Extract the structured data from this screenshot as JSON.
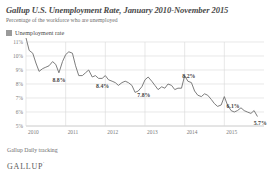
{
  "title": "Gallup U.S. Unemployment Rate, January 2010-November 2015",
  "subtitle": "Percentage of the workforce who are unemployed",
  "legend": {
    "label": "Unemployment rate",
    "swatch_color": "#9a9a9a"
  },
  "footnote": "Gallup Daily tracking",
  "brand": "GALLUP",
  "brand_mark": "'",
  "colors": {
    "line": "#6e6e6e",
    "grid": "#d9d9d9",
    "axis": "#bdbdbd",
    "text": "#6d6d6d",
    "label": "#3f3f3f"
  },
  "chart_data": {
    "type": "line",
    "title": "Gallup U.S. Unemployment Rate, January 2010-November 2015",
    "subtitle": "Percentage of the workforce who are unemployed",
    "xlabel": "",
    "ylabel": "",
    "ylim": [
      5,
      11
    ],
    "yticks": [
      "5%",
      "6%",
      "7%",
      "8%",
      "9%",
      "10%",
      "11%"
    ],
    "ytick_values": [
      5,
      6,
      7,
      8,
      9,
      10,
      11
    ],
    "xticks": [
      "2010",
      "2011",
      "2012",
      "2013",
      "2014",
      "2015"
    ],
    "xtick_values": [
      2010,
      2011,
      2012,
      2013,
      2014,
      2015
    ],
    "grid": true,
    "legend_position": "top-left",
    "series": [
      {
        "name": "Unemployment rate",
        "color": "#6e6e6e",
        "x": [
          2010.0,
          2010.08,
          2010.17,
          2010.25,
          2010.33,
          2010.42,
          2010.5,
          2010.58,
          2010.67,
          2010.75,
          2010.83,
          2010.92,
          2011.0,
          2011.08,
          2011.17,
          2011.25,
          2011.33,
          2011.42,
          2011.5,
          2011.58,
          2011.67,
          2011.75,
          2011.83,
          2011.92,
          2012.0,
          2012.08,
          2012.17,
          2012.25,
          2012.33,
          2012.42,
          2012.5,
          2012.58,
          2012.67,
          2012.75,
          2012.83,
          2012.92,
          2013.0,
          2013.08,
          2013.17,
          2013.25,
          2013.33,
          2013.42,
          2013.5,
          2013.58,
          2013.67,
          2013.75,
          2013.83,
          2013.92,
          2014.0,
          2014.08,
          2014.17,
          2014.25,
          2014.33,
          2014.42,
          2014.5,
          2014.58,
          2014.67,
          2014.75,
          2014.83,
          2014.92,
          2015.0,
          2015.08,
          2015.17,
          2015.25,
          2015.33,
          2015.42,
          2015.5,
          2015.58,
          2015.67,
          2015.75,
          2015.83
        ],
        "values": [
          11.3,
          10.4,
          10.2,
          9.5,
          8.9,
          9.1,
          9.2,
          9.3,
          9.6,
          9.4,
          8.8,
          9.6,
          10.1,
          10.3,
          10.2,
          9.3,
          8.6,
          8.6,
          8.8,
          9.0,
          8.5,
          8.6,
          8.4,
          8.4,
          8.6,
          8.3,
          8.2,
          8.1,
          7.9,
          8.1,
          8.2,
          8.1,
          7.9,
          7.4,
          7.5,
          7.8,
          8.3,
          8.5,
          8.2,
          7.9,
          7.6,
          7.8,
          7.7,
          8.0,
          7.9,
          7.6,
          7.7,
          7.7,
          8.6,
          8.2,
          8.1,
          7.5,
          7.2,
          7.1,
          7.3,
          7.2,
          6.9,
          6.6,
          6.4,
          6.5,
          7.1,
          6.5,
          6.1,
          6.0,
          6.1,
          6.3,
          6.1,
          6.0,
          5.9,
          6.1,
          5.7
        ]
      }
    ],
    "annotations": [
      {
        "label": "8.8%",
        "x": 2010.83,
        "y": 8.8
      },
      {
        "label": "8.4%",
        "x": 2011.83,
        "y": 8.4
      },
      {
        "label": "7.8%",
        "x": 2012.92,
        "y": 7.8
      },
      {
        "label": "8.2%",
        "x": 2014.08,
        "y": 8.2
      },
      {
        "label": "6.1%",
        "x": 2015.17,
        "y": 6.1
      },
      {
        "label": "5.7%",
        "x": 2015.83,
        "y": 5.7
      }
    ]
  }
}
